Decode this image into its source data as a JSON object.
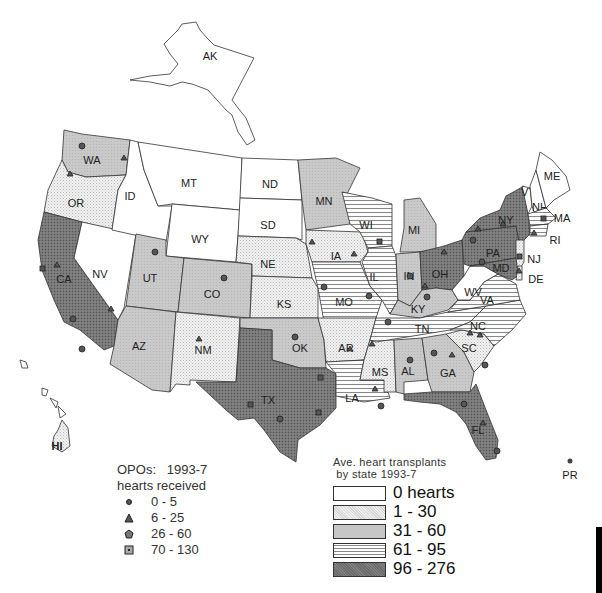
{
  "map": {
    "title": "Ave. heart transplants by state 1993-7",
    "fill_colors": {
      "0": "#ffffff",
      "1-30": "#ececec",
      "31-60": "#c6c6c6",
      "61-95": "#f4f4f4",
      "96-276": "#6f6f6f"
    },
    "state_labels": [
      "AK",
      "WA",
      "OR",
      "CA",
      "NV",
      "ID",
      "MT",
      "WY",
      "UT",
      "CO",
      "AZ",
      "NM",
      "ND",
      "SD",
      "NE",
      "KS",
      "OK",
      "TX",
      "MN",
      "IA",
      "MO",
      "AR",
      "LA",
      "WI",
      "IL",
      "MI",
      "IN",
      "OH",
      "KY",
      "TN",
      "MS",
      "AL",
      "GA",
      "FL",
      "SC",
      "NC",
      "VA",
      "WV",
      "PA",
      "NY",
      "VT",
      "NH",
      "ME",
      "MA",
      "RI",
      "NJ",
      "DE",
      "MD",
      "HI",
      "PR"
    ],
    "state_categories": {
      "0": [
        "AK",
        "ID",
        "MT",
        "WY",
        "ND",
        "SD",
        "NV",
        "WV",
        "ME",
        "VT",
        "NH"
      ],
      "1-30": [
        "OR",
        "NE",
        "KS",
        "NM",
        "IA",
        "MO",
        "AR",
        "MS",
        "SC",
        "NJ",
        "DE"
      ],
      "31-60": [
        "WA",
        "UT",
        "CO",
        "AZ",
        "MN",
        "OK",
        "MI",
        "IN",
        "KY",
        "AL",
        "GA"
      ],
      "61-95": [
        "WI",
        "IL",
        "TN",
        "LA",
        "VA",
        "NC",
        "MA",
        "RI"
      ],
      "96-276": [
        "CA",
        "TX",
        "OH",
        "PA",
        "NY",
        "FL",
        "MD"
      ]
    }
  },
  "opo_legend": {
    "title": "OPOs:   1993-7\nhearts received",
    "items": [
      {
        "symbol": "dot-icon",
        "label": "0 - 5"
      },
      {
        "symbol": "triangle-icon",
        "label": "6 - 25"
      },
      {
        "symbol": "pentagon-icon",
        "label": "26 - 60"
      },
      {
        "symbol": "square-icon",
        "label": "70 - 130"
      }
    ]
  },
  "state_legend": {
    "title": "Ave. heart transplants\n by state 1993-7",
    "items": [
      {
        "label": "0 hearts",
        "fill": "#ffffff",
        "pattern": "none"
      },
      {
        "label": "1 - 30",
        "fill": "#ececec",
        "pattern": "stipple"
      },
      {
        "label": "31 - 60",
        "fill": "#c6c6c6",
        "pattern": "solid"
      },
      {
        "label": "61 - 95",
        "fill": "#f4f4f4",
        "pattern": "horizontal-lines"
      },
      {
        "label": "96 - 276",
        "fill": "#6f6f6f",
        "pattern": "dark-stipple"
      }
    ]
  }
}
